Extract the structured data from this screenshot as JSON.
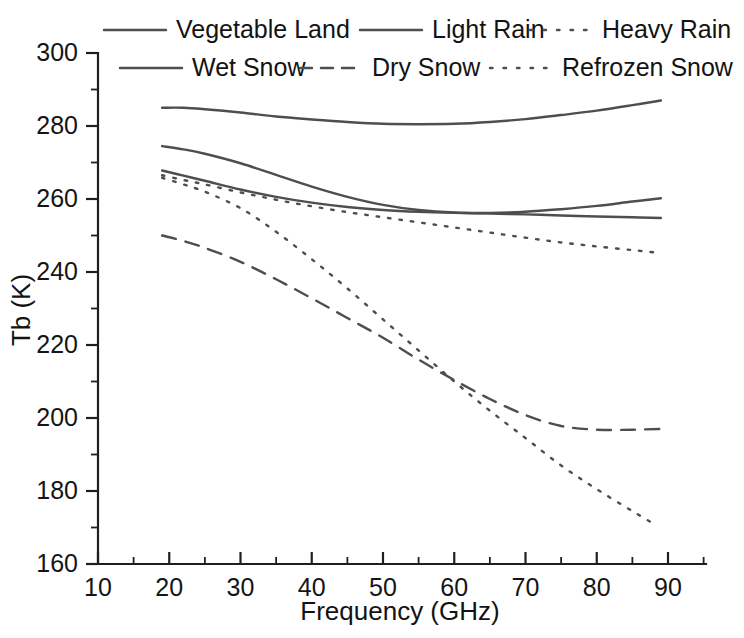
{
  "chart_data": {
    "type": "line",
    "title": "",
    "xlabel": "Frequency (GHz)",
    "ylabel": "Tb (K)",
    "xlim": [
      10,
      95
    ],
    "ylim": [
      160,
      300
    ],
    "xticks": [
      10,
      20,
      30,
      40,
      50,
      60,
      70,
      80,
      90
    ],
    "yticks": [
      160,
      180,
      200,
      220,
      240,
      260,
      280,
      300
    ],
    "xtick_labels": [
      "10",
      "20",
      "30",
      "40",
      "50",
      "60",
      "70",
      "80",
      "90"
    ],
    "ytick_labels": [
      "160",
      "180",
      "200",
      "220",
      "240",
      "260",
      "280",
      "300"
    ],
    "x_minor_step": 5,
    "y_minor_step": 10,
    "grid": false,
    "legend_position": "top",
    "legend_entries": [
      {
        "label": "Vegetable Land",
        "style": "solid"
      },
      {
        "label": "Light Rain",
        "style": "solid"
      },
      {
        "label": "Heavy Rain",
        "style": "dotted"
      },
      {
        "label": "Wet Snow",
        "style": "solid"
      },
      {
        "label": "Dry Snow",
        "style": "dashed"
      },
      {
        "label": "Refrozen Snow",
        "style": "dotted"
      }
    ],
    "series": [
      {
        "name": "Vegetable Land",
        "style": "solid",
        "x": [
          19,
          22,
          25,
          30,
          35,
          40,
          45,
          50,
          55,
          60,
          65,
          70,
          75,
          80,
          85,
          89
        ],
        "values": [
          285.0,
          285.0,
          284.6,
          283.7,
          282.6,
          281.8,
          281.1,
          280.6,
          280.5,
          280.6,
          281.1,
          281.9,
          283.0,
          284.2,
          285.7,
          287.0
        ]
      },
      {
        "name": "Wet Snow",
        "style": "solid",
        "x": [
          19,
          22,
          25,
          30,
          35,
          40,
          45,
          50,
          55,
          60,
          65,
          70,
          75,
          80,
          85,
          89
        ],
        "values": [
          274.5,
          273.6,
          272.4,
          269.8,
          266.6,
          263.4,
          260.6,
          258.4,
          257.0,
          256.3,
          256.2,
          256.5,
          257.2,
          258.1,
          259.3,
          260.2
        ]
      },
      {
        "name": "Light Rain",
        "style": "solid",
        "x": [
          19,
          22,
          25,
          30,
          35,
          40,
          45,
          50,
          55,
          60,
          65,
          70,
          75,
          80,
          85,
          89
        ],
        "values": [
          267.8,
          266.4,
          265.0,
          262.6,
          260.6,
          259.0,
          257.8,
          257.0,
          256.5,
          256.2,
          256.0,
          255.8,
          255.5,
          255.2,
          255.0,
          254.8
        ]
      },
      {
        "name": "Refrozen Snow",
        "style": "dotted",
        "x": [
          19,
          22,
          25,
          30,
          35,
          40,
          45,
          50,
          55,
          60,
          65,
          70,
          75,
          80,
          85,
          89
        ],
        "values": [
          266.5,
          265.2,
          264.0,
          261.8,
          259.8,
          258.0,
          256.4,
          255.0,
          253.6,
          252.2,
          250.8,
          249.4,
          248.1,
          247.0,
          246.0,
          245.2
        ]
      },
      {
        "name": "Heavy Rain",
        "style": "dotted",
        "x": [
          19,
          22,
          25,
          30,
          35,
          40,
          45,
          50,
          55,
          60,
          65,
          70,
          75,
          80,
          85,
          88
        ],
        "values": [
          265.8,
          264.0,
          262.0,
          257.5,
          251.0,
          243.5,
          235.5,
          227.0,
          218.5,
          210.0,
          202.0,
          194.5,
          187.0,
          180.5,
          174.5,
          171.0
        ]
      },
      {
        "name": "Dry Snow",
        "style": "dashed",
        "x": [
          19,
          22,
          25,
          30,
          35,
          40,
          45,
          50,
          55,
          60,
          65,
          70,
          75,
          80,
          85,
          89
        ],
        "values": [
          250.0,
          248.5,
          246.6,
          242.8,
          238.0,
          232.8,
          227.4,
          222.0,
          216.0,
          210.4,
          205.2,
          200.8,
          197.8,
          196.8,
          196.8,
          197.0
        ]
      }
    ]
  },
  "style": {
    "line_color": "#4e4e4e",
    "axis_color": "#1f1f1f",
    "text_color": "#151515",
    "background": "#ffffff"
  }
}
